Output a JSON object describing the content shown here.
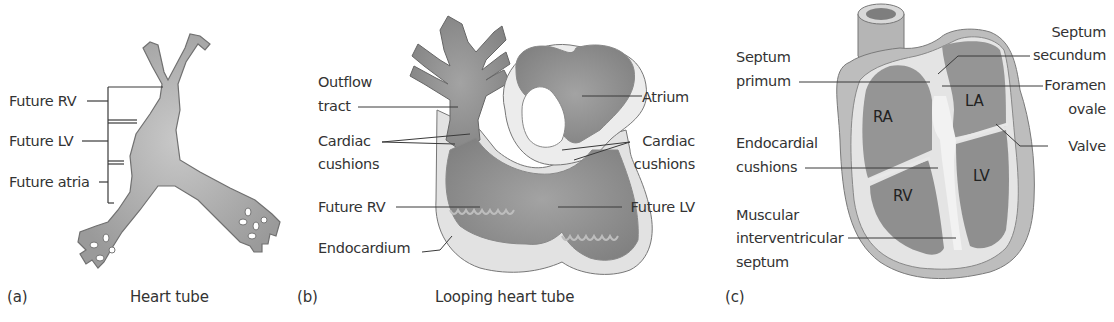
{
  "figure": {
    "panels": [
      {
        "id": "a",
        "letter": "(a)",
        "caption": "Heart tube",
        "labels": [
          "Future RV",
          "Future LV",
          "Future atria"
        ]
      },
      {
        "id": "b",
        "letter": "(b)",
        "caption": "Looping heart tube",
        "left_labels": [
          "Outflow",
          "tract",
          "Cardiac",
          "cushions",
          "Future RV",
          "Endocardium"
        ],
        "right_labels": [
          "Atrium",
          "Cardiac",
          "cushions",
          "Future LV"
        ]
      },
      {
        "id": "c",
        "letter": "(c)",
        "caption": "",
        "left_labels": [
          "Septum",
          "primum",
          "Endocardial",
          "cushions",
          "Muscular",
          "interventricular",
          "septum"
        ],
        "right_labels": [
          "Septum",
          "secundum",
          "Foramen",
          "ovale",
          "Valve"
        ],
        "chamber_labels": [
          "RA",
          "LA",
          "RV",
          "LV"
        ]
      }
    ]
  },
  "colors": {
    "tissue_dark": "#8c8c8c",
    "tissue_mid": "#a9a9a9",
    "tissue_light": "#dcdcdc",
    "outline": "#6e6e6e",
    "leader": "#3a3a3a"
  }
}
